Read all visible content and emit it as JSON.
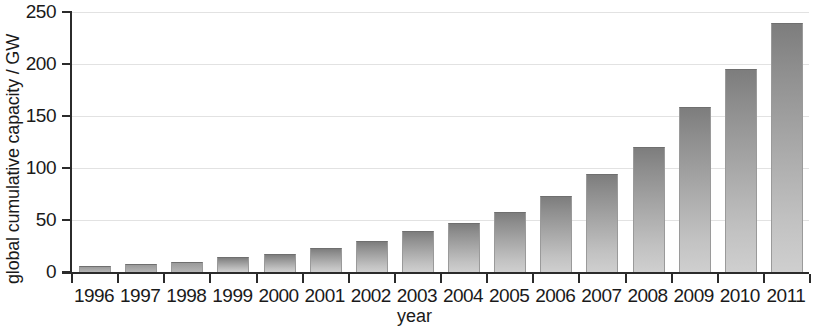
{
  "chart_data": {
    "type": "bar",
    "title": "",
    "xlabel": "year",
    "ylabel": "global cumulative capacity / GW",
    "categories": [
      "1996",
      "1997",
      "1998",
      "1999",
      "2000",
      "2001",
      "2002",
      "2003",
      "2004",
      "2005",
      "2006",
      "2007",
      "2008",
      "2009",
      "2010",
      "2011"
    ],
    "values": [
      5,
      7,
      9,
      13,
      16,
      22,
      29,
      38,
      46,
      57,
      72,
      93,
      119,
      158,
      194,
      238
    ],
    "ylim": [
      0,
      250
    ],
    "yticks": [
      0,
      50,
      100,
      150,
      200,
      250
    ],
    "ytick_labels": [
      "0",
      "50",
      "100",
      "150",
      "200",
      "250"
    ],
    "grid": true,
    "legend": null,
    "bar_color_top": "#7d7d7d",
    "bar_color_bottom": "#cfcfcf",
    "axis_color": "#2b2b2b",
    "grid_color": "#e2e2e2",
    "background": "#ffffff"
  }
}
